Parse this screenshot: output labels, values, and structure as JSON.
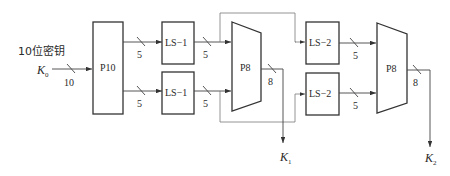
{
  "diagram": {
    "title": "10位密钥",
    "input": {
      "label": "K",
      "subscript": "0",
      "width_label": "10"
    },
    "blocks": {
      "p10": "P10",
      "ls1_top": "LS−1",
      "ls1_bottom": "LS−1",
      "p8_first": "P8",
      "ls2_top": "LS−2",
      "ls2_bottom": "LS−2",
      "p8_second": "P8"
    },
    "bus_widths": {
      "p10_to_ls1_top": "5",
      "p10_to_ls1_bottom": "5",
      "ls1_top_to_p8": "5",
      "ls1_bottom_to_p8": "5",
      "p8_first_out": "8",
      "ls2_top_to_p8": "5",
      "ls2_bottom_to_p8": "5",
      "p8_second_out": "8"
    },
    "outputs": {
      "k1": {
        "label": "K",
        "subscript": "1"
      },
      "k2": {
        "label": "K",
        "subscript": "2"
      }
    }
  }
}
